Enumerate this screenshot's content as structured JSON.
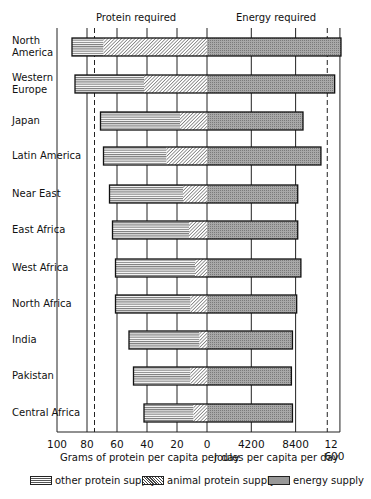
{
  "chart_data": {
    "type": "bar",
    "orientation": "horizontal",
    "title": "",
    "header_labels": {
      "left": "Protein required",
      "right": "Energy required"
    },
    "categories": [
      "North America",
      "Western Europe",
      "Japan",
      "Latin America",
      "Near East",
      "East Africa",
      "West Africa",
      "North Africa",
      "India",
      "Pakistan",
      "Central Africa"
    ],
    "category_display": [
      [
        "North",
        "America"
      ],
      [
        "Western",
        "Europe"
      ],
      [
        "Japan"
      ],
      [
        "Latin America"
      ],
      [
        "Near East"
      ],
      [
        "East Africa"
      ],
      [
        "West Africa"
      ],
      [
        "North Africa"
      ],
      [
        "India"
      ],
      [
        "Pakistan"
      ],
      [
        "Central Africa"
      ]
    ],
    "series": [
      {
        "name": "other protein supply",
        "unit": "g/capita/day",
        "values": [
          21,
          46,
          53,
          42,
          49,
          51,
          53,
          50,
          47,
          38,
          33
        ]
      },
      {
        "name": "animal protein supply",
        "unit": "g/capita/day",
        "values": [
          69,
          42,
          18,
          27,
          16,
          12,
          8,
          11,
          5,
          11,
          9
        ]
      },
      {
        "name": "energy supply",
        "unit": "J/capita/day",
        "values": [
          12700,
          12100,
          9100,
          10800,
          8600,
          8600,
          8900,
          8500,
          8100,
          8000,
          8100
        ]
      }
    ],
    "total_protein": [
      90,
      88,
      71,
      69,
      65,
      63,
      61,
      61,
      52,
      49,
      42
    ],
    "protein_required_g": 75,
    "energy_required_J": 11400,
    "left_axis": {
      "label": "Grams of protein per capita per day",
      "ticks": [
        100,
        80,
        60,
        40,
        20,
        0
      ],
      "tick_labels": [
        "100",
        "80",
        "60",
        "40",
        "20",
        "0"
      ],
      "range": [
        100,
        0
      ]
    },
    "right_axis": {
      "label": "Joules per capita per day",
      "ticks": [
        4200,
        8400,
        12600
      ],
      "tick_labels": [
        "4200",
        "8400",
        "12 600"
      ],
      "range": [
        0,
        12600
      ]
    },
    "legend": [
      {
        "label": "other protein supply",
        "pattern": "horizontal-lines"
      },
      {
        "label": "animal protein supply",
        "pattern": "diagonal-hatch"
      },
      {
        "label": "energy supply",
        "pattern": "grey-stipple"
      }
    ],
    "legend_position": "bottom",
    "grid": "vertical at ticks",
    "colors": {
      "energy": "#999999",
      "line": "#222222"
    }
  },
  "geometry": {
    "zero_x": 207,
    "protein_px_per_g": 1.5,
    "energy_px_per_J": 0.01055,
    "bar_tops": [
      38,
      75,
      112,
      147,
      185,
      221,
      259,
      295,
      331,
      367,
      404
    ],
    "bar_height": 18,
    "axis_y": 432,
    "frame_left_x": 57
  }
}
